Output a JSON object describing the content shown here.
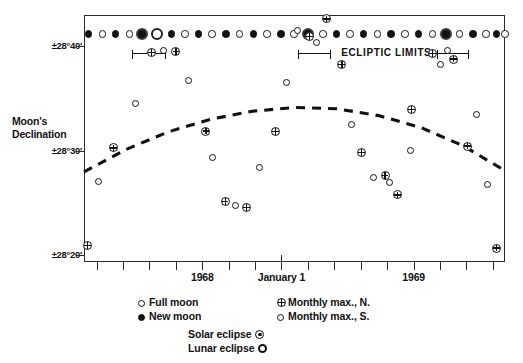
{
  "chart_data": {
    "type": "scatter",
    "title": "",
    "xlabel": "",
    "ylabel": "Moon's Declination",
    "ylim": [
      28.3222,
      28.7167
    ],
    "y_ticks": [
      {
        "value": 28.6667,
        "label": "±28°40'"
      },
      {
        "value": 28.5,
        "label": "±28°30'"
      },
      {
        "value": 28.3333,
        "label": "±28°20'"
      }
    ],
    "x_ticks": [
      {
        "x": 0.03,
        "label": "",
        "major": false
      },
      {
        "x": 0.092,
        "label": "",
        "major": false
      },
      {
        "x": 0.155,
        "label": "",
        "major": false
      },
      {
        "x": 0.218,
        "label": "",
        "major": false
      },
      {
        "x": 0.281,
        "label": "1968",
        "major": false
      },
      {
        "x": 0.344,
        "label": "",
        "major": false
      },
      {
        "x": 0.406,
        "label": "",
        "major": false
      },
      {
        "x": 0.469,
        "label": "January 1",
        "major": true
      },
      {
        "x": 0.532,
        "label": "",
        "major": false
      },
      {
        "x": 0.594,
        "label": "",
        "major": false
      },
      {
        "x": 0.657,
        "label": "",
        "major": false
      },
      {
        "x": 0.72,
        "label": "",
        "major": false
      },
      {
        "x": 0.783,
        "label": "1969",
        "major": false
      },
      {
        "x": 0.845,
        "label": "",
        "major": false
      },
      {
        "x": 0.908,
        "label": "",
        "major": false
      },
      {
        "x": 0.971,
        "label": "",
        "major": false
      }
    ],
    "grid": false,
    "legend_position": "below-plot",
    "series": [
      {
        "name": "Monthly max., N.",
        "symbol": "circle-with-cross",
        "points": [
          {
            "x": 0.006,
            "y": 28.35
          },
          {
            "x": 0.068,
            "y": 28.506
          },
          {
            "x": 0.158,
            "y": 28.658
          },
          {
            "x": 0.216,
            "y": 28.66
          },
          {
            "x": 0.287,
            "y": 28.533
          },
          {
            "x": 0.333,
            "y": 28.42
          },
          {
            "x": 0.383,
            "y": 28.411
          },
          {
            "x": 0.452,
            "y": 28.532
          },
          {
            "x": 0.533,
            "y": 28.684
          },
          {
            "x": 0.573,
            "y": 28.712
          },
          {
            "x": 0.61,
            "y": 28.639
          },
          {
            "x": 0.657,
            "y": 28.499
          },
          {
            "x": 0.713,
            "y": 28.462
          },
          {
            "x": 0.742,
            "y": 28.431
          },
          {
            "x": 0.776,
            "y": 28.567
          },
          {
            "x": 0.826,
            "y": 28.657
          },
          {
            "x": 0.876,
            "y": 28.648
          },
          {
            "x": 0.909,
            "y": 28.509
          },
          {
            "x": 0.978,
            "y": 28.346
          }
        ]
      },
      {
        "name": "Monthly max., S.",
        "symbol": "open-circle",
        "points": [
          {
            "x": 0.031,
            "y": 28.452
          },
          {
            "x": 0.12,
            "y": 28.577
          },
          {
            "x": 0.187,
            "y": 28.662
          },
          {
            "x": 0.245,
            "y": 28.613
          },
          {
            "x": 0.302,
            "y": 28.491
          },
          {
            "x": 0.358,
            "y": 28.414
          },
          {
            "x": 0.415,
            "y": 28.474
          },
          {
            "x": 0.478,
            "y": 28.61
          },
          {
            "x": 0.505,
            "y": 28.694
          },
          {
            "x": 0.549,
            "y": 28.675
          },
          {
            "x": 0.632,
            "y": 28.543
          },
          {
            "x": 0.685,
            "y": 28.458
          },
          {
            "x": 0.724,
            "y": 28.45
          },
          {
            "x": 0.773,
            "y": 28.502
          },
          {
            "x": 0.845,
            "y": 28.64
          },
          {
            "x": 0.861,
            "y": 28.662
          },
          {
            "x": 0.93,
            "y": 28.56
          },
          {
            "x": 0.955,
            "y": 28.447
          }
        ]
      }
    ],
    "trend_curve": {
      "name": "mean maximum declination",
      "style": "dashed",
      "points": [
        {
          "x": 0.0,
          "y": 28.466
        },
        {
          "x": 0.1,
          "y": 28.502
        },
        {
          "x": 0.2,
          "y": 28.53
        },
        {
          "x": 0.3,
          "y": 28.55
        },
        {
          "x": 0.4,
          "y": 28.563
        },
        {
          "x": 0.5,
          "y": 28.569
        },
        {
          "x": 0.6,
          "y": 28.567
        },
        {
          "x": 0.7,
          "y": 28.556
        },
        {
          "x": 0.8,
          "y": 28.537
        },
        {
          "x": 0.9,
          "y": 28.508
        },
        {
          "x": 1.0,
          "y": 28.468
        }
      ]
    },
    "phase_row": {
      "label": "lunar phases",
      "markers": [
        {
          "x": 0.008,
          "type": "new"
        },
        {
          "x": 0.041,
          "type": "full"
        },
        {
          "x": 0.073,
          "type": "new"
        },
        {
          "x": 0.106,
          "type": "full"
        },
        {
          "x": 0.136,
          "type": "solar"
        },
        {
          "x": 0.17,
          "type": "lunar"
        },
        {
          "x": 0.205,
          "type": "new"
        },
        {
          "x": 0.237,
          "type": "full"
        },
        {
          "x": 0.27,
          "type": "new"
        },
        {
          "x": 0.302,
          "type": "full"
        },
        {
          "x": 0.335,
          "type": "new"
        },
        {
          "x": 0.367,
          "type": "full"
        },
        {
          "x": 0.4,
          "type": "new"
        },
        {
          "x": 0.432,
          "type": "full"
        },
        {
          "x": 0.465,
          "type": "new"
        },
        {
          "x": 0.497,
          "type": "full"
        },
        {
          "x": 0.53,
          "type": "solar"
        },
        {
          "x": 0.565,
          "type": "full"
        },
        {
          "x": 0.597,
          "type": "new"
        },
        {
          "x": 0.63,
          "type": "full"
        },
        {
          "x": 0.662,
          "type": "new"
        },
        {
          "x": 0.695,
          "type": "full"
        },
        {
          "x": 0.727,
          "type": "new"
        },
        {
          "x": 0.76,
          "type": "full"
        },
        {
          "x": 0.792,
          "type": "new"
        },
        {
          "x": 0.825,
          "type": "full"
        },
        {
          "x": 0.857,
          "type": "solar"
        },
        {
          "x": 0.89,
          "type": "full"
        },
        {
          "x": 0.922,
          "type": "new"
        },
        {
          "x": 0.952,
          "type": "full"
        },
        {
          "x": 0.978,
          "type": "new"
        },
        {
          "x": 0.998,
          "type": "full"
        }
      ]
    },
    "ecliptic_limits": {
      "label": "ECLIPTIC LIMITS",
      "bars": [
        {
          "x_start": 0.112,
          "x_end": 0.192
        },
        {
          "x_start": 0.507,
          "x_end": 0.585
        },
        {
          "x_start": 0.835,
          "x_end": 0.912
        }
      ]
    },
    "legend": {
      "entries": [
        {
          "symbol": "open-circle",
          "label": "Full moon",
          "column": 0,
          "row": 0
        },
        {
          "symbol": "filled-circle",
          "label": "New moon",
          "column": 0,
          "row": 1
        },
        {
          "symbol": "circle-with-cross",
          "label": "Monthly  max., N.",
          "column": 1,
          "row": 0
        },
        {
          "symbol": "open-circle",
          "label": "Monthly  max., S.",
          "column": 1,
          "row": 1
        }
      ],
      "eclipse_entries": [
        {
          "label": "Solar  eclipse",
          "symbol": "circle-with-dot"
        },
        {
          "label": "Lunar eclipse",
          "symbol": "double-circle"
        }
      ]
    },
    "colors": {
      "ink": "#111111",
      "frame": "#2a2a2a",
      "background": "#ffffff"
    }
  }
}
